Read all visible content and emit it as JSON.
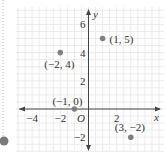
{
  "chart_data": {
    "type": "scatter",
    "title": "",
    "xlabel": "x",
    "ylabel": "y",
    "origin_label": "O",
    "xlim": [
      -5,
      5
    ],
    "ylim": [
      -3,
      7
    ],
    "grid": true,
    "x_ticks": [
      {
        "v": -4,
        "label": "−4"
      },
      {
        "v": -2,
        "label": "−2"
      },
      {
        "v": 2,
        "label": "2"
      }
    ],
    "y_ticks": [
      {
        "v": 6,
        "label": "6"
      },
      {
        "v": 4,
        "label": "4"
      },
      {
        "v": 2,
        "label": "2"
      },
      {
        "v": -2,
        "label": "−2"
      }
    ],
    "points": [
      {
        "x": 1,
        "y": 5,
        "label": "(1, 5)"
      },
      {
        "x": -2,
        "y": 4,
        "label": "(−2, 4)"
      },
      {
        "x": -1,
        "y": 0,
        "label": "(−1, 0)"
      },
      {
        "x": 3,
        "y": -2,
        "label": "(3, −2)"
      }
    ],
    "colors": {
      "grid": "#e6e6e6",
      "axis": "#444444",
      "point": "#808080",
      "text": "#333333"
    }
  },
  "decor": {
    "dotted_line_color": "#b0b0b0",
    "marker_color": "#7a7a7a"
  }
}
